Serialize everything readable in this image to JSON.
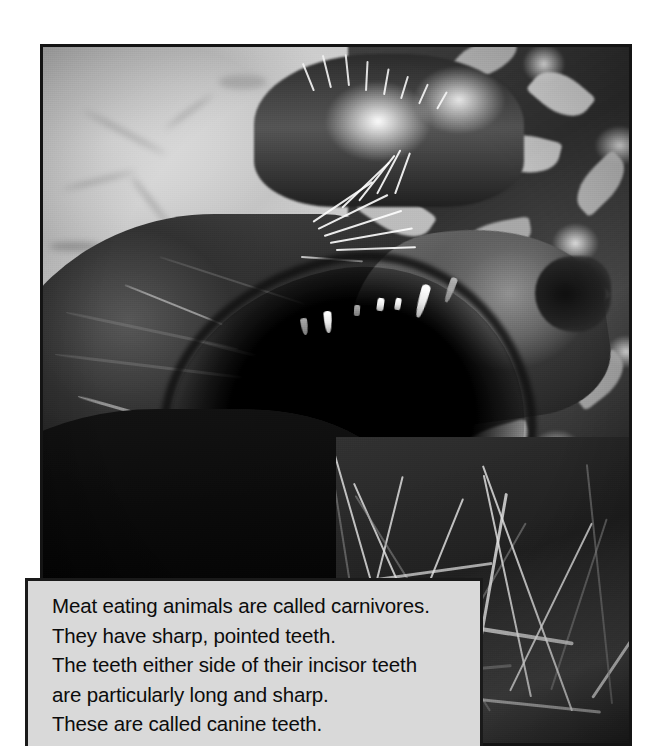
{
  "page": {
    "background_color": "#ffffff",
    "width": 668,
    "height": 746
  },
  "photo": {
    "alt_description": "Black and white photograph of a lion roaring with its mouth wide open, showing long pointed canine teeth, with leafy vegetation in the background",
    "subject": "roaring-lion",
    "border_color": "#141414",
    "treatment": "black-and-white"
  },
  "caption": {
    "background_color": "#d9d9d9",
    "border_color": "#1a1a1a",
    "text_color": "#0c0c0c",
    "lines": [
      "Meat eating animals are called carnivores.",
      "They have sharp, pointed teeth.",
      "The teeth either side of their incisor teeth",
      "are particularly long and sharp.",
      "These are called canine teeth."
    ]
  }
}
